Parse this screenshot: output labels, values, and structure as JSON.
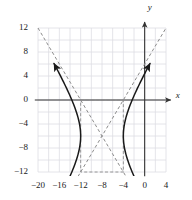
{
  "chart_data": {
    "type": "line",
    "title": "",
    "subtitle": "",
    "xlabel": "x",
    "ylabel": "y",
    "xlim": [
      -21.5,
      5.5
    ],
    "ylim": [
      -13.5,
      13.5
    ],
    "grid": true,
    "grid_step": 2,
    "legend": "none",
    "xticks": [
      -20,
      -16,
      -12,
      -8,
      -4,
      0,
      4
    ],
    "xtick_labels": [
      "−20",
      "−16",
      "−12",
      "−8",
      "−4",
      "0",
      "4"
    ],
    "yticks": [
      12,
      8,
      4,
      0,
      -4,
      -8,
      -12
    ],
    "ytick_labels": [
      "12",
      "8",
      "4",
      "0",
      "−4",
      "−8",
      "−12"
    ],
    "curve_kind": "hyperbola",
    "center": [
      -8,
      -6
    ],
    "transverse_axis": "horizontal",
    "a": 4,
    "b": 6,
    "vertices": [
      [
        -12,
        -6
      ],
      [
        -4,
        -6
      ]
    ],
    "asymptote_slopes": [
      1.5,
      -1.5
    ],
    "bounding_box": {
      "x0": -12,
      "x1": -4,
      "y0": -12,
      "y1": 0
    },
    "series": [
      {
        "name": "hyperbola-left-branch",
        "style": "solid",
        "color": "#1a1a1a",
        "arrows": [
          "start",
          "end"
        ],
        "x": [
          -20.0,
          -19.2,
          -18.4,
          -17.6,
          -16.8,
          -16.0,
          -15.2,
          -14.4,
          -13.6,
          -12.8,
          -12.4,
          -12.1,
          -12.0,
          -12.1,
          -12.4,
          -12.8,
          -13.6,
          -14.4,
          -15.2,
          -16.0,
          -16.8,
          -17.6,
          -18.4,
          -19.2,
          -20.0
        ],
        "y": [
          7.0,
          5.9,
          4.8,
          3.7,
          2.5,
          1.4,
          0.2,
          -1.1,
          -2.5,
          -4.1,
          -5.0,
          -5.7,
          -6.0,
          -6.3,
          -7.0,
          -7.9,
          -9.5,
          -10.9,
          -12.2,
          -13.4,
          -14.5,
          -15.7,
          -16.8,
          -17.9,
          -19.0
        ]
      },
      {
        "name": "hyperbola-right-branch",
        "style": "solid",
        "color": "#1a1a1a",
        "arrows": [
          "start",
          "end"
        ],
        "x": [
          4.0,
          3.2,
          2.4,
          1.6,
          0.8,
          0.0,
          -0.8,
          -1.6,
          -2.4,
          -3.2,
          -3.6,
          -3.9,
          -4.0,
          -3.9,
          -3.6,
          -3.2,
          -2.4,
          -1.6,
          -0.8,
          0.0,
          0.8,
          1.6,
          2.4,
          3.2,
          4.0
        ],
        "y": [
          3.5,
          2.4,
          1.3,
          0.1,
          -1.1,
          -2.2,
          -3.4,
          -4.7,
          -6.0,
          -7.4,
          -8.3,
          -9.0,
          -9.3,
          -9.6,
          -10.3,
          -11.2,
          -12.8,
          -14.2,
          -15.5,
          -16.7,
          -17.8,
          -19.0,
          -20.1,
          -21.2,
          -22.3
        ]
      }
    ],
    "asymptotes": [
      {
        "name": "asymptote-positive-slope",
        "style": "dashed",
        "color": "#8c8c8c",
        "from": [
          -20.0,
          -24.0
        ],
        "to": [
          4.0,
          12.0
        ],
        "slope": 1.5,
        "intercept": 6.0
      },
      {
        "name": "asymptote-negative-slope",
        "style": "dashed",
        "color": "#8c8c8c",
        "from": [
          -20.0,
          12.0
        ],
        "to": [
          4.0,
          -24.0
        ],
        "slope": -1.5,
        "intercept": -18.0
      }
    ],
    "annotations": [
      {
        "name": "central-box",
        "style": "dashed",
        "color": "#8c8c8c",
        "kind": "rectangle",
        "x0": -12,
        "y0": -12,
        "x1": -4,
        "y1": 0
      }
    ]
  },
  "axes": {
    "x_axis_name": "x",
    "y_axis_name": "y",
    "x_axis_arrow": true,
    "y_axis_arrow": true
  },
  "colors": {
    "curve": "#1a1a1a",
    "asymptote": "#8c8c8c",
    "axis": "#333333",
    "grid": "#dddde3",
    "text": "#1a1a1a",
    "background": "#ffffff"
  }
}
